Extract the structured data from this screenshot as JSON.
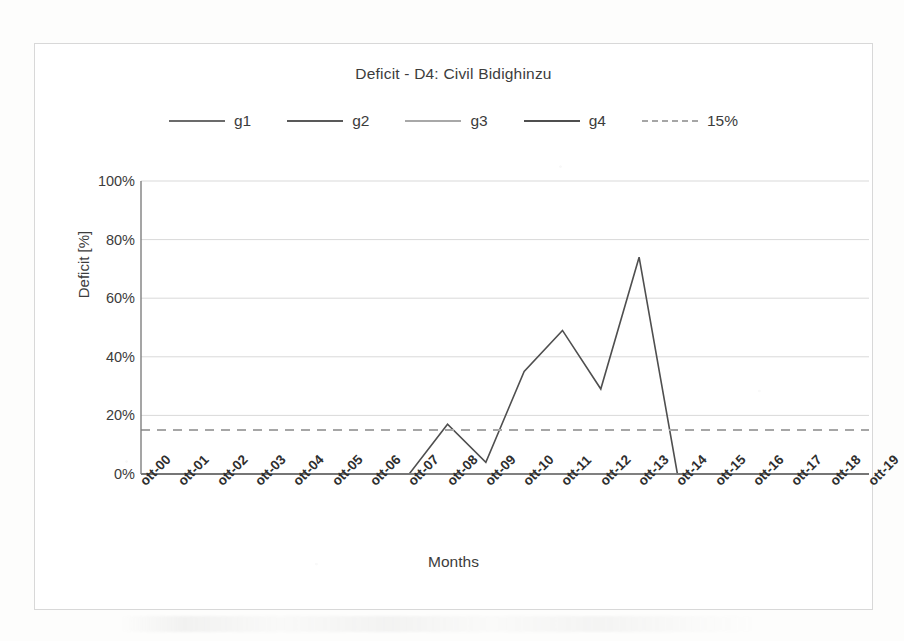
{
  "chart_data": {
    "type": "line",
    "title": "Deficit - D4: Civil Bidighinzu",
    "xlabel": "Months",
    "ylabel": "Deficit [%]",
    "ylim": [
      0,
      100
    ],
    "ytick_labels": [
      "0%",
      "20%",
      "40%",
      "60%",
      "80%",
      "100%"
    ],
    "ytick_values": [
      0,
      20,
      40,
      60,
      80,
      100
    ],
    "grid": true,
    "legend_position": "top-center",
    "categories": [
      "ott-00",
      "ott-01",
      "ott-02",
      "ott-03",
      "ott-04",
      "ott-05",
      "ott-06",
      "ott-07",
      "ott-08",
      "ott-09",
      "ott-10",
      "ott-11",
      "ott-12",
      "ott-13",
      "ott-14",
      "ott-15",
      "ott-16",
      "ott-17",
      "ott-18",
      "ott-19"
    ],
    "series": [
      {
        "name": "g1",
        "color": "#6b6b6b",
        "style": "solid",
        "values": [
          0,
          0,
          0,
          0,
          0,
          0,
          0,
          0,
          0,
          0,
          0,
          0,
          0,
          0,
          0,
          0,
          0,
          0,
          0,
          0
        ]
      },
      {
        "name": "g2",
        "color": "#595959",
        "style": "solid",
        "values": [
          0,
          0,
          0,
          0,
          0,
          0,
          0,
          0,
          0,
          0,
          0,
          0,
          0,
          0,
          0,
          0,
          0,
          0,
          0,
          0
        ]
      },
      {
        "name": "g3",
        "color": "#8f8f8f",
        "style": "solid",
        "values": [
          0,
          0,
          0,
          0,
          0,
          0,
          0,
          0,
          0,
          0,
          0,
          0,
          0,
          0,
          0,
          0,
          0,
          0,
          0,
          0
        ]
      },
      {
        "name": "g4",
        "color": "#4f4f4f",
        "style": "solid",
        "values": [
          0,
          0,
          0,
          0,
          0,
          0,
          0,
          0,
          17,
          4,
          35,
          49,
          29,
          74,
          0,
          0,
          0,
          0,
          0,
          0
        ],
        "peaks": [
          {
            "x": "ott-08",
            "value": 17
          },
          {
            "x": "ott-09",
            "value": 4
          },
          {
            "x": "ott-10",
            "value": 35
          },
          {
            "x": "ott-11",
            "value": 49
          },
          {
            "x": "ott-12",
            "value": 29
          },
          {
            "x": "ott-13",
            "value": 74
          }
        ]
      },
      {
        "name": "15%",
        "color": "#a6a6a6",
        "style": "dashed",
        "threshold": 15,
        "values": [
          15,
          15,
          15,
          15,
          15,
          15,
          15,
          15,
          15,
          15,
          15,
          15,
          15,
          15,
          15,
          15,
          15,
          15,
          15,
          15
        ]
      }
    ]
  },
  "legend": {
    "items": [
      {
        "label": "g1",
        "color": "#6b6b6b",
        "style": "solid"
      },
      {
        "label": "g2",
        "color": "#595959",
        "style": "solid"
      },
      {
        "label": "g3",
        "color": "#a8a8a8",
        "style": "solid"
      },
      {
        "label": "g4",
        "color": "#4f4f4f",
        "style": "solid"
      },
      {
        "label": "15%",
        "color": "#a6a6a6",
        "style": "dashed"
      }
    ]
  },
  "colors": {
    "background": "#ffffff",
    "frame_border": "#d8d8d8",
    "gridline": "#d9d9d9",
    "axis_line": "#7f7f7f",
    "text": "#3c3c3c"
  }
}
